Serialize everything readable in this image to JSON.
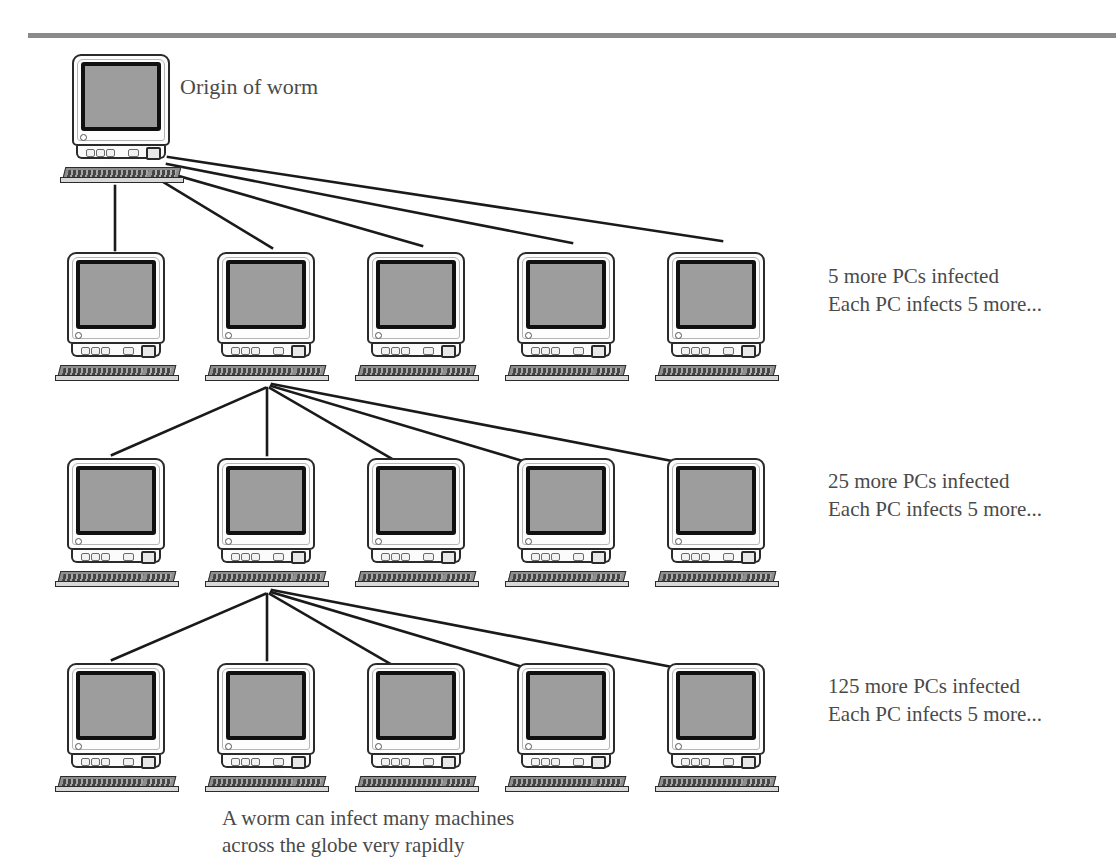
{
  "diagram": {
    "origin_label": "Origin of worm",
    "caption_line1": "A worm can infect many machines",
    "caption_line2": "across the globe very rapidly",
    "fanout": 5,
    "node_icon": "desktop-computer-icon",
    "colors": {
      "line": "#1a1a1a",
      "text": "#4a4a4a",
      "screen": "#9d9d9d",
      "bezel": "#111111",
      "rule": "#8a8a8a"
    },
    "levels": [
      {
        "index": 0,
        "count": 1,
        "label_line1": "",
        "label_line2": "",
        "nodes": [
          {
            "x": 60,
            "y": 54
          }
        ]
      },
      {
        "index": 1,
        "count": 5,
        "label_line1": "5 more PCs infected",
        "label_line2": "Each PC infects 5 more...",
        "label_x": 828,
        "label_y": 262,
        "nodes": [
          {
            "x": 55,
            "y": 252
          },
          {
            "x": 205,
            "y": 252
          },
          {
            "x": 355,
            "y": 252
          },
          {
            "x": 505,
            "y": 252
          },
          {
            "x": 655,
            "y": 252
          }
        ]
      },
      {
        "index": 2,
        "count": 25,
        "label_line1": "25 more PCs infected",
        "label_line2": "Each PC infects 5 more...",
        "label_x": 828,
        "label_y": 467,
        "nodes": [
          {
            "x": 55,
            "y": 458
          },
          {
            "x": 205,
            "y": 458
          },
          {
            "x": 355,
            "y": 458
          },
          {
            "x": 505,
            "y": 458
          },
          {
            "x": 655,
            "y": 458
          }
        ]
      },
      {
        "index": 3,
        "count": 125,
        "label_line1": "125 more PCs infected",
        "label_line2": "Each PC infects 5 more...",
        "label_x": 828,
        "label_y": 672,
        "nodes": [
          {
            "x": 55,
            "y": 663
          },
          {
            "x": 205,
            "y": 663
          },
          {
            "x": 355,
            "y": 663
          },
          {
            "x": 505,
            "y": 663
          },
          {
            "x": 655,
            "y": 663
          }
        ]
      }
    ],
    "edges": [
      {
        "from": "L0N0",
        "to": "L1N0",
        "x1": 115,
        "y1": 186,
        "x2": 115,
        "y2": 250
      },
      {
        "from": "L0N0",
        "to": "L1N1",
        "x1": 160,
        "y1": 180,
        "x2": 272,
        "y2": 248
      },
      {
        "from": "L0N0",
        "to": "L1N2",
        "x1": 165,
        "y1": 172,
        "x2": 422,
        "y2": 246
      },
      {
        "from": "L0N0",
        "to": "L1N3",
        "x1": 167,
        "y1": 164,
        "x2": 572,
        "y2": 243
      },
      {
        "from": "L0N0",
        "to": "L1N4",
        "x1": 168,
        "y1": 157,
        "x2": 722,
        "y2": 241
      },
      {
        "from": "L1N1",
        "to": "L2N0",
        "x1": 265,
        "y1": 388,
        "x2": 112,
        "y2": 455
      },
      {
        "from": "L1N1",
        "to": "L2N1",
        "x1": 267,
        "y1": 388,
        "x2": 267,
        "y2": 455
      },
      {
        "from": "L1N1",
        "to": "L2N2",
        "x1": 270,
        "y1": 388,
        "x2": 425,
        "y2": 478
      },
      {
        "from": "L1N1",
        "to": "L2N3",
        "x1": 271,
        "y1": 386,
        "x2": 580,
        "y2": 478
      },
      {
        "from": "L1N1",
        "to": "L2N4",
        "x1": 272,
        "y1": 384,
        "x2": 750,
        "y2": 476
      },
      {
        "from": "L2N1",
        "to": "L3N0",
        "x1": 265,
        "y1": 594,
        "x2": 112,
        "y2": 660
      },
      {
        "from": "L2N1",
        "to": "L3N1",
        "x1": 267,
        "y1": 594,
        "x2": 267,
        "y2": 660
      },
      {
        "from": "L2N1",
        "to": "L3N2",
        "x1": 270,
        "y1": 594,
        "x2": 425,
        "y2": 684
      },
      {
        "from": "L2N1",
        "to": "L3N3",
        "x1": 271,
        "y1": 592,
        "x2": 580,
        "y2": 684
      },
      {
        "from": "L2N1",
        "to": "L3N4",
        "x1": 272,
        "y1": 590,
        "x2": 750,
        "y2": 682
      }
    ]
  }
}
